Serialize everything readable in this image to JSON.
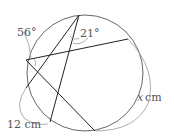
{
  "diagram": {
    "type": "circle-geometry",
    "circle": {
      "cx": 85,
      "cy": 73,
      "r": 58
    },
    "points": {
      "T": [
        79,
        15
      ],
      "L": [
        26,
        60
      ],
      "R": [
        128,
        39
      ],
      "LL": [
        26,
        88
      ],
      "BL": [
        50,
        122
      ],
      "B": [
        95,
        131
      ]
    },
    "chords": [
      [
        "T",
        "LL"
      ],
      [
        "T",
        "BL"
      ],
      [
        "L",
        "R"
      ],
      [
        "L",
        "B"
      ]
    ],
    "labels": {
      "angle_top": "21°",
      "angle_arc": "56°",
      "arc_left": "12 cm",
      "arc_right_var": "x",
      "arc_right_unit": "cm"
    },
    "colors": {
      "line": "#222222",
      "circle": "#555555",
      "annotation": "#999999",
      "text": "#555555"
    }
  }
}
